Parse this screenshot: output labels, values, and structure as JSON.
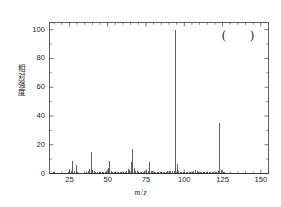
{
  "figure": {
    "type": "mass-spectrum",
    "annotation_left": "(",
    "annotation_right": ")"
  },
  "axes": {
    "y_title": "相对强度",
    "x_title_italic_m": "m",
    "x_title_slash": "/",
    "x_title_italic_z": "z",
    "y_ticks": [
      0,
      20,
      40,
      60,
      80,
      100
    ],
    "x_ticks": [
      25,
      50,
      75,
      100,
      125,
      150
    ]
  },
  "chart_data": {
    "type": "bar",
    "title": "",
    "subtitle": "",
    "xlabel": "m / z",
    "ylabel": "相对强度",
    "xlim": [
      12,
      155
    ],
    "ylim": [
      0,
      105
    ],
    "grid": false,
    "legend": null,
    "x_ticks": [
      25,
      50,
      75,
      100,
      125,
      150
    ],
    "y_ticks": [
      0,
      20,
      40,
      60,
      80,
      100
    ],
    "x_minor_tick_step": 5,
    "y_minor_tick_step": 10,
    "base_peak_mz": 94,
    "annotations": [
      "(",
      ")"
    ],
    "x": [
      13,
      14,
      15,
      18,
      20,
      24,
      25,
      26,
      27,
      28,
      29,
      30,
      31,
      36,
      37,
      38,
      39,
      40,
      41,
      42,
      43,
      44,
      45,
      46,
      47,
      48,
      49,
      50,
      51,
      52,
      53,
      54,
      55,
      56,
      57,
      58,
      59,
      60,
      61,
      62,
      63,
      64,
      65,
      66,
      67,
      68,
      69,
      70,
      71,
      72,
      73,
      74,
      75,
      76,
      77,
      78,
      79,
      80,
      81,
      82,
      83,
      84,
      85,
      86,
      87,
      88,
      89,
      90,
      91,
      92,
      93,
      94,
      95,
      96,
      97,
      98,
      99,
      100,
      101,
      102,
      103,
      104,
      105,
      106,
      107,
      108,
      109,
      110,
      111,
      112,
      113,
      114,
      115,
      116,
      117,
      118,
      119,
      120,
      121,
      122,
      123,
      124,
      125,
      126,
      127,
      130,
      135,
      140,
      145,
      150
    ],
    "values": [
      0.6,
      0.8,
      1.0,
      0.5,
      0.6,
      1.2,
      2.2,
      2.0,
      9.0,
      1.5,
      6.0,
      1.0,
      0.6,
      1.2,
      2.0,
      3.0,
      15.0,
      2.2,
      1.5,
      1.0,
      1.2,
      0.8,
      0.8,
      0.8,
      0.8,
      1.2,
      1.5,
      3.5,
      9.0,
      1.5,
      1.2,
      0.8,
      1.0,
      0.8,
      0.8,
      0.8,
      1.0,
      0.8,
      1.2,
      2.0,
      3.0,
      2.5,
      8.0,
      17.0,
      4.0,
      1.5,
      1.5,
      0.8,
      0.8,
      0.8,
      1.2,
      1.5,
      2.5,
      2.0,
      8.0,
      2.0,
      1.5,
      1.0,
      1.0,
      0.8,
      1.0,
      0.8,
      0.8,
      0.8,
      1.0,
      1.2,
      1.5,
      1.5,
      2.0,
      2.0,
      2.0,
      100.0,
      6.5,
      1.5,
      1.0,
      0.8,
      0.8,
      1.0,
      0.8,
      0.8,
      0.8,
      1.0,
      1.2,
      2.0,
      2.5,
      1.5,
      1.0,
      0.8,
      0.8,
      0.8,
      0.8,
      0.8,
      0.8,
      0.8,
      0.8,
      0.8,
      0.8,
      0.8,
      1.0,
      1.5,
      35.0,
      2.5,
      1.0,
      0.8,
      0.6,
      0.5,
      0.5,
      0.5,
      0.5,
      0.5
    ],
    "peaks_labeled": [
      {
        "mz": 27,
        "intensity": 9
      },
      {
        "mz": 29,
        "intensity": 6
      },
      {
        "mz": 39,
        "intensity": 15
      },
      {
        "mz": 51,
        "intensity": 9
      },
      {
        "mz": 65,
        "intensity": 8
      },
      {
        "mz": 66,
        "intensity": 17
      },
      {
        "mz": 77,
        "intensity": 8
      },
      {
        "mz": 94,
        "intensity": 100
      },
      {
        "mz": 95,
        "intensity": 6.5
      },
      {
        "mz": 123,
        "intensity": 35
      }
    ]
  }
}
